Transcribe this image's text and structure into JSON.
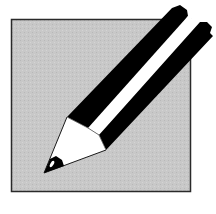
{
  "icon": {
    "name": "pencil-edit-icon",
    "colors": {
      "background": "#ffffff",
      "box_fill": "#c6c6c6",
      "box_border": "#2a2a2a",
      "pencil_stripe_dark": "#000000",
      "pencil_stripe_light": "#ffffff",
      "cone": "#ffffff",
      "lead": "#000000"
    }
  }
}
